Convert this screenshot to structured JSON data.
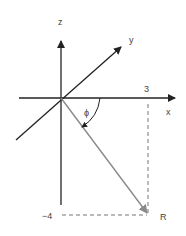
{
  "diagram": {
    "axes": {
      "x_label": "x",
      "y_label": "y",
      "z_label": "z"
    },
    "ticks": {
      "x_value": "3",
      "z_value": "−4"
    },
    "angle_label": "ϕ",
    "point_label": "R",
    "colors": {
      "axis": "#222222",
      "vector": "#8a8a8a",
      "dashed": "#777777",
      "text": "#444444"
    }
  }
}
